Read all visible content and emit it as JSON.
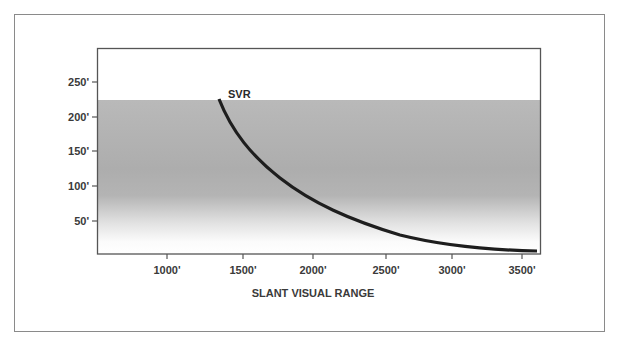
{
  "chart_data": {
    "type": "line",
    "title": "",
    "xlabel": "SLANT VISUAL RANGE",
    "ylabel": "",
    "x_ticks": [
      "1000'",
      "1500'",
      "2000'",
      "2500'",
      "3000'",
      "3500'"
    ],
    "y_ticks": [
      "50'",
      "100'",
      "150'",
      "200'",
      "250'"
    ],
    "xlim": [
      510,
      3640
    ],
    "ylim": [
      0,
      290
    ],
    "grid": false,
    "legend": "none",
    "annotations": [
      {
        "text": "SVR",
        "x": 1420,
        "y": 232
      }
    ],
    "shaded_band": {
      "from": 0,
      "to": 224,
      "description": "grey gradient band, darkest mid, fading to white near ground"
    },
    "series": [
      {
        "name": "SVR",
        "x": [
          1366,
          1445,
          1585,
          1726,
          1937,
          2148,
          2289,
          2465,
          2641,
          2817,
          2993,
          3240,
          3599
        ],
        "y": [
          226,
          189,
          152,
          124,
          89,
          66,
          53,
          40,
          30,
          24,
          19,
          13,
          7
        ]
      }
    ]
  },
  "axes": {
    "x_title": "SLANT VISUAL RANGE",
    "x_ticks": [
      {
        "label": "1000'",
        "px": 167
      },
      {
        "label": "1500'",
        "px": 243
      },
      {
        "label": "2000'",
        "px": 313
      },
      {
        "label": "2500'",
        "px": 386
      },
      {
        "label": "3000'",
        "px": 452
      },
      {
        "label": "3500'",
        "px": 522
      }
    ],
    "y_ticks": [
      {
        "label": "250'",
        "py": 82
      },
      {
        "label": "200'",
        "py": 117
      },
      {
        "label": "150'",
        "py": 151
      },
      {
        "label": "100'",
        "py": 186
      },
      {
        "label": "50'",
        "py": 221
      }
    ]
  },
  "series_label": "SVR",
  "colors": {
    "frame": "#8a8a8a",
    "axis": "#555555",
    "curve": "#1e1e1e",
    "band_top": "#b8b8b8",
    "band_mid": "#aeaeae",
    "band_bottom": "#ffffff"
  }
}
